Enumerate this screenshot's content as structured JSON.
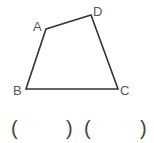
{
  "diagram": {
    "shape": "quadrilateral",
    "vertices": [
      {
        "label": "A",
        "x": 46,
        "y": 29
      },
      {
        "label": "D",
        "x": 91,
        "y": 15
      },
      {
        "label": "C",
        "x": 118,
        "y": 89
      },
      {
        "label": "B",
        "x": 26,
        "y": 89
      }
    ],
    "stroke_color": "#333333"
  },
  "answer_blanks": {
    "blank1_open": "(",
    "blank1_close": ")",
    "blank2_open": "(",
    "blank2_close": ")"
  }
}
